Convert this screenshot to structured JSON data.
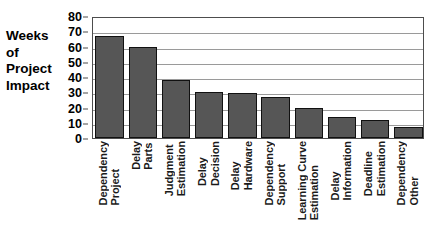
{
  "artifact": {
    "top_ghost_text": "",
    "corner_ghost_text": ""
  },
  "axis_title_lines": [
    "Weeks",
    "of",
    "Project",
    "Impact"
  ],
  "chart_data": {
    "type": "bar",
    "title": "",
    "xlabel": "",
    "ylabel": "Weeks of Project Impact",
    "ylim": [
      0,
      80
    ],
    "yticks": [
      0,
      10,
      20,
      30,
      40,
      50,
      60,
      70,
      80
    ],
    "grid": true,
    "legend": "none",
    "bar_color": "#565656",
    "bar_edge_color": "#111111",
    "categories": [
      "Project Dependency",
      "Parts Delay",
      "Estimation Judgment",
      "Decision Delay",
      "Hardware Delay",
      "Support Dependency",
      "Estimation Learning Curve",
      "Information Delay",
      "Estimation Deadline",
      "Other Dependency"
    ],
    "category_words": [
      [
        "Project",
        "Dependency"
      ],
      [
        "Parts",
        "Delay"
      ],
      [
        "Estimation",
        "Judgment"
      ],
      [
        "Decision",
        "Delay"
      ],
      [
        "Hardware",
        "Delay"
      ],
      [
        "Support",
        "Dependency"
      ],
      [
        "Estimation",
        "Learning Curve"
      ],
      [
        "Information",
        "Delay"
      ],
      [
        "Estimation",
        "Deadline"
      ],
      [
        "Other",
        "Dependency"
      ]
    ],
    "values": [
      67,
      59.5,
      38,
      30.5,
      29.5,
      27,
      20,
      14,
      12,
      7
    ]
  }
}
